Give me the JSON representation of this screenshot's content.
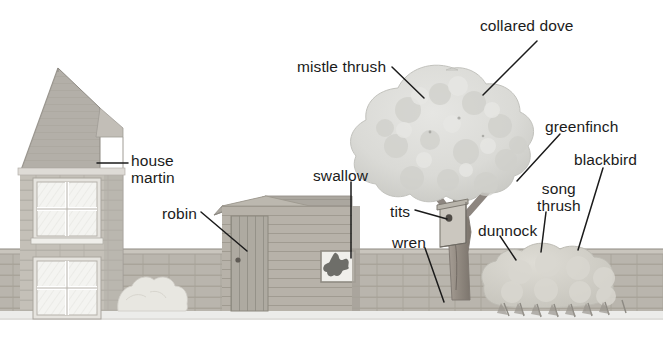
{
  "illustration": {
    "title": "Garden birds habitat diagram",
    "description": "A line-and-wash garden scene with a house, garden wall, shed, tree with nest box and a hedge, annotated with bird names and leader lines.",
    "background_color": "#ffffff",
    "ink_color": "#1b1b1b",
    "palette": {
      "sky": "#ffffff",
      "canopy": "#dcdcdc",
      "canopy_shadow": "#c9c9c9",
      "trunk": "#9a9289",
      "trunk_shadow": "#7d766e",
      "wall_brick": "#b9b5ad",
      "wall_shadow": "#a6a29a",
      "house_wall": "#c4c0b8",
      "roof": "#b0aca5",
      "roof_light": "#c8c5bf",
      "shed_wood": "#b7b2a9",
      "shed_roof": "#a8a49d",
      "hedge": "#d2d0c9",
      "bush": "#e4e3dd",
      "window_pane": "#f4f4f1",
      "nestbox": "#cbc7bf",
      "swallow": "#6a6a66",
      "ground": "#e8e7e2"
    }
  },
  "labels": [
    {
      "id": "house-martin",
      "text": "house\nmartin",
      "x": 131,
      "y": 152,
      "align": "left"
    },
    {
      "id": "mistle-thrush",
      "text": "mistle thrush",
      "x": 297,
      "y": 58,
      "align": "left"
    },
    {
      "id": "collared-dove",
      "text": "collared dove",
      "x": 480,
      "y": 17,
      "align": "left"
    },
    {
      "id": "greenfinch",
      "text": "greenfinch",
      "x": 545,
      "y": 118,
      "align": "left"
    },
    {
      "id": "blackbird",
      "text": "blackbird",
      "x": 574,
      "y": 151,
      "align": "left"
    },
    {
      "id": "swallow",
      "text": "swallow",
      "x": 313,
      "y": 167,
      "align": "left"
    },
    {
      "id": "robin",
      "text": "robin",
      "x": 162,
      "y": 205,
      "align": "left"
    },
    {
      "id": "song-thrush",
      "text": "song\nthrush",
      "x": 537,
      "y": 180,
      "align": "left"
    },
    {
      "id": "tits",
      "text": "tits",
      "x": 390,
      "y": 203,
      "align": "left"
    },
    {
      "id": "dunnock",
      "text": "dunnock",
      "x": 478,
      "y": 222,
      "align": "left"
    },
    {
      "id": "wren",
      "text": "wren",
      "x": 392,
      "y": 234,
      "align": "left"
    }
  ],
  "leader_lines": [
    {
      "id": "house-martin-leader",
      "points": "97,163 128,163"
    },
    {
      "id": "mistle-thrush-leader",
      "points": "392,67 424,98"
    },
    {
      "id": "collared-dove-leader",
      "points": "537,41 483,95"
    },
    {
      "id": "greenfinch-leader",
      "points": "560,134 517,181"
    },
    {
      "id": "blackbird-leader",
      "points": "603,168 578,250"
    },
    {
      "id": "swallow-leader",
      "points": "351,182 351,258"
    },
    {
      "id": "robin-leader",
      "points": "201,212 247,251"
    },
    {
      "id": "song-thrush-leader",
      "points": "546,212 541,252"
    },
    {
      "id": "tits-leader",
      "points": "415,210 447,219"
    },
    {
      "id": "dunnock-leader",
      "points": "500,236 516,260"
    },
    {
      "id": "wren-leader",
      "points": "425,248 444,302"
    }
  ],
  "scene_objects": [
    {
      "id": "house",
      "label": "brick house with gable roof and two sash windows"
    },
    {
      "id": "garden-wall",
      "label": "low brick garden wall"
    },
    {
      "id": "shed",
      "label": "wooden garden shed with plank door and window"
    },
    {
      "id": "tree",
      "label": "broadleaf tree with dense canopy and forked trunk"
    },
    {
      "id": "nest-box",
      "label": "nest box mounted on tree trunk"
    },
    {
      "id": "hedge",
      "label": "rounded hedge at right"
    },
    {
      "id": "small-bush",
      "label": "small pale bush against wall"
    },
    {
      "id": "swallow-silhouette",
      "label": "dark swallow shape in shed window"
    }
  ]
}
